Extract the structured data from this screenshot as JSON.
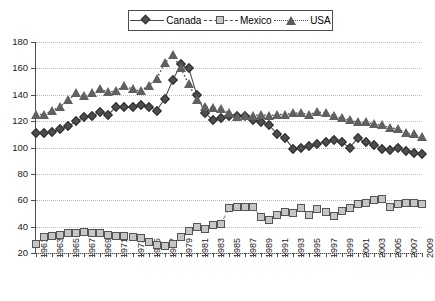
{
  "chart_data": {
    "type": "line",
    "title": "",
    "subtitle": "",
    "xlabel": "",
    "ylabel": "",
    "ylim": [
      20,
      180
    ],
    "ytick_values": [
      20,
      40,
      60,
      80,
      100,
      120,
      140,
      160,
      180
    ],
    "ytick_labels": [
      "20",
      "40",
      "60",
      "80",
      "100",
      "120",
      "140",
      "160",
      "180"
    ],
    "grid": true,
    "legend_position": "top-center",
    "x": [
      1961,
      1962,
      1963,
      1964,
      1965,
      1966,
      1967,
      1968,
      1969,
      1970,
      1971,
      1972,
      1973,
      1974,
      1975,
      1976,
      1977,
      1978,
      1979,
      1980,
      1981,
      1982,
      1983,
      1984,
      1985,
      1986,
      1987,
      1988,
      1989,
      1990,
      1991,
      1992,
      1993,
      1994,
      1995,
      1996,
      1997,
      1998,
      1999,
      2000,
      2001,
      2002,
      2003,
      2004,
      2005,
      2006,
      2007,
      2008,
      2009
    ],
    "xtick_labels": [
      "1961",
      "1963",
      "1965",
      "1967",
      "1969",
      "1971",
      "1973",
      "1975",
      "1977",
      "1979",
      "1981",
      "1983",
      "1985",
      "1987",
      "1989",
      "1991",
      "1993",
      "1995",
      "1997",
      "1999",
      "2001",
      "2003",
      "2005",
      "2007",
      "2009"
    ],
    "series": [
      {
        "name": "Canada",
        "marker": "diamond",
        "line_style": "solid",
        "color": "#4d4d4d",
        "values": [
          111,
          111,
          112,
          114,
          116,
          120,
          123,
          124,
          127,
          125,
          131,
          131,
          131,
          132,
          131,
          128,
          137,
          151,
          163,
          160,
          140,
          126,
          121,
          122,
          124,
          124,
          124,
          121,
          119,
          117,
          110,
          107,
          99,
          100,
          101,
          103,
          104,
          106,
          104,
          100,
          107,
          104,
          102,
          99,
          98,
          100,
          97,
          96,
          95
        ]
      },
      {
        "name": "Mexico",
        "marker": "square",
        "line_style": "dashed",
        "color": "#c6c6c6",
        "values": [
          27,
          32,
          33,
          34,
          35,
          35,
          36,
          35,
          35,
          34,
          33,
          33,
          32,
          31,
          28,
          26,
          25,
          27,
          32,
          37,
          40,
          38,
          41,
          42,
          54,
          55,
          55,
          55,
          47,
          45,
          49,
          51,
          50,
          54,
          49,
          53,
          51,
          48,
          52,
          54,
          57,
          58,
          60,
          61,
          55,
          57,
          58,
          58,
          57
        ]
      },
      {
        "name": "USA",
        "marker": "triangle",
        "line_style": "dotted",
        "color": "#606060",
        "values": [
          125,
          125,
          128,
          131,
          136,
          141,
          139,
          141,
          144,
          142,
          143,
          147,
          144,
          143,
          147,
          152,
          164,
          170,
          160,
          148,
          136,
          131,
          130,
          129,
          126,
          123,
          124,
          124,
          125,
          124,
          125,
          125,
          126,
          126,
          125,
          127,
          126,
          124,
          122,
          121,
          119,
          119,
          118,
          117,
          115,
          114,
          111,
          110,
          108
        ]
      }
    ]
  }
}
